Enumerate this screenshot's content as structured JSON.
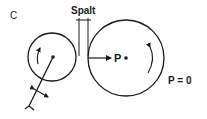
{
  "figure": {
    "panel_label": "C",
    "gap_label": "Spalt",
    "point_label": "P",
    "pressure_label": "P = 0",
    "colors": {
      "stroke": "#1a1a1a",
      "background": "#ffffff"
    },
    "elements": {
      "small_roller": {
        "cx": 52,
        "cy": 57,
        "r": 24,
        "rotation": "counterclockwise"
      },
      "large_roller": {
        "cx": 126,
        "cy": 58,
        "r": 38,
        "rotation": "clockwise"
      },
      "gap_markers": {
        "x_left": 79,
        "x_right": 88,
        "y_top": 20,
        "y_bottom": 55
      },
      "pressure_arrow": {
        "from_x": 88,
        "to_x": 111,
        "y": 58
      },
      "lever": {
        "from": [
          53,
          57
        ],
        "to": [
          29,
          106
        ]
      }
    }
  }
}
